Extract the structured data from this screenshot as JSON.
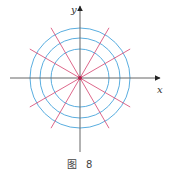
{
  "figure": {
    "caption": "图 8",
    "x_axis_label": "x",
    "y_axis_label": "y",
    "origin": [
      80,
      78
    ],
    "circle_radii": [
      29,
      40,
      50
    ],
    "ray_length": 58,
    "ray_angles_deg": [
      30,
      60,
      120,
      150,
      210,
      240,
      300,
      330
    ],
    "x_axis_extent": [
      10,
      160
    ],
    "y_axis_extent": [
      6,
      152
    ],
    "colors": {
      "circle": "#5aaee0",
      "ray": "#d9577e",
      "axis": "#666666",
      "origin_dot": "#b0204a"
    }
  }
}
